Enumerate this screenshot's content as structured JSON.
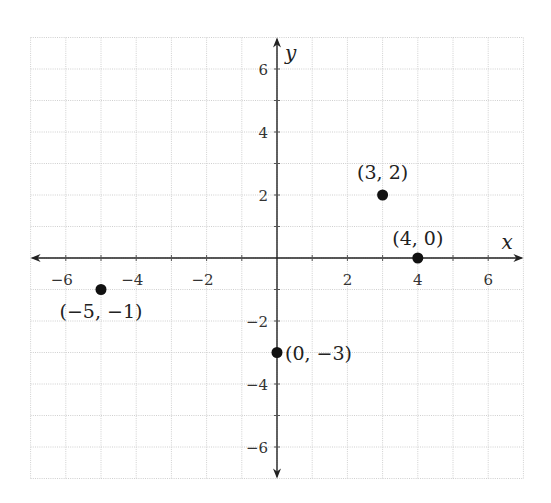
{
  "chart_data": {
    "type": "scatter",
    "title": "",
    "xlabel": "x",
    "ylabel": "y",
    "xlim": [
      -7,
      7
    ],
    "ylim": [
      -7,
      7
    ],
    "grid": true,
    "x_ticks": [
      -6,
      -4,
      -2,
      2,
      4,
      6
    ],
    "y_ticks": [
      6,
      4,
      2,
      -2,
      -4,
      -6
    ],
    "x_tick_labels": [
      "−6",
      "−4",
      "−2",
      "2",
      "4",
      "6"
    ],
    "y_tick_labels": [
      "6",
      "4",
      "2",
      "−2",
      "−4",
      "−6"
    ],
    "points": [
      {
        "x": 3,
        "y": 2,
        "label": "(3, 2)"
      },
      {
        "x": 4,
        "y": 0,
        "label": "(4, 0)"
      },
      {
        "x": -5,
        "y": -1,
        "label": "(−5, −1)"
      },
      {
        "x": 0,
        "y": -3,
        "label": "(0, −3)"
      }
    ],
    "colors": {
      "point": "#111111",
      "axis": "#222222",
      "grid": "#cfcfcf"
    }
  },
  "layout": {
    "origin_px": [
      277,
      258
    ],
    "unit_px": [
      35.2,
      31.5
    ]
  }
}
